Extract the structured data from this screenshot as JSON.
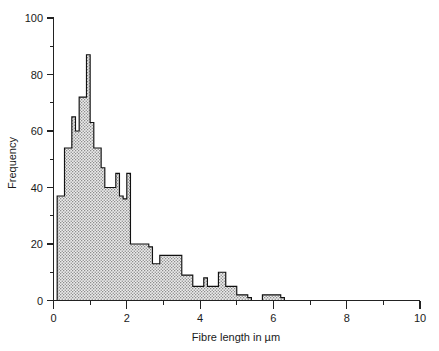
{
  "chart_data": {
    "type": "bar",
    "subtype": "histogram",
    "title": "",
    "xlabel": "Fibre length in µm",
    "ylabel": "Frequency",
    "xlim": [
      0,
      10
    ],
    "ylim": [
      0,
      100
    ],
    "bin_width": 0.1,
    "grid": false,
    "legend": null,
    "xticks": [
      0,
      2,
      4,
      6,
      8,
      10
    ],
    "xticklabels": [
      "0",
      "2",
      "4",
      "6",
      "8",
      "10"
    ],
    "xminor_ticks": [
      1,
      3,
      5,
      7,
      9
    ],
    "yticks": [
      0,
      20,
      40,
      60,
      80,
      100
    ],
    "yticklabels": [
      "0",
      "20",
      "40",
      "60",
      "80",
      "100"
    ],
    "yminor_ticks": [
      10,
      30,
      50,
      70,
      90
    ],
    "bin_starts": [
      0.1,
      0.2,
      0.3,
      0.4,
      0.5,
      0.6,
      0.7,
      0.8,
      0.9,
      1.0,
      1.1,
      1.2,
      1.3,
      1.4,
      1.5,
      1.6,
      1.7,
      1.8,
      1.9,
      2.0,
      2.1,
      2.2,
      2.3,
      2.4,
      2.5,
      2.6,
      2.7,
      2.8,
      2.9,
      3.0,
      3.1,
      3.2,
      3.3,
      3.4,
      3.5,
      3.6,
      3.7,
      3.8,
      3.9,
      4.0,
      4.1,
      4.2,
      4.3,
      4.4,
      4.5,
      4.6,
      4.7,
      4.8,
      4.9,
      5.0,
      5.1,
      5.2,
      5.3,
      5.4,
      5.5,
      5.6,
      5.7,
      5.8,
      5.9,
      6.0,
      6.1,
      6.2
    ],
    "values": [
      37,
      37,
      54,
      54,
      65,
      60,
      72,
      72,
      87,
      63,
      54,
      54,
      47,
      40,
      40,
      40,
      45,
      37,
      36,
      45,
      20,
      20,
      20,
      20,
      20,
      19,
      13,
      13,
      16,
      16,
      16,
      16,
      16,
      16,
      9,
      9,
      9,
      5,
      5,
      5,
      8,
      5,
      5,
      5,
      10,
      10,
      5,
      5,
      5,
      2,
      2,
      2,
      1,
      0,
      0,
      0,
      2,
      2,
      2,
      2,
      2,
      1
    ],
    "series_name": "Fibre length distribution",
    "max_value": 87,
    "max_value_bin": 0.9,
    "fill_pattern": "dotted-stipple",
    "fill_color": "#d9d9d9",
    "outline_color": "#111111"
  },
  "axes": {
    "x_axis_name": "x-axis",
    "y_axis_name": "y-axis"
  }
}
